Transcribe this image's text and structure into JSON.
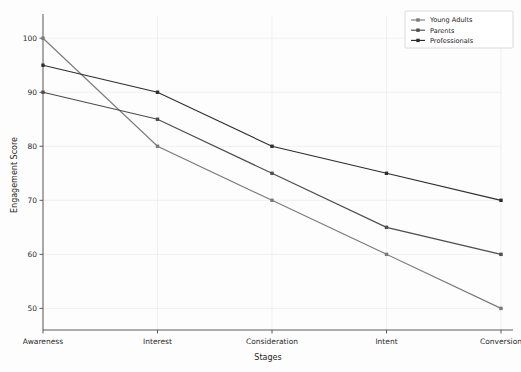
{
  "chart_data": {
    "type": "line",
    "title": "",
    "xlabel": "Stages",
    "ylabel": "Engagement Score",
    "categories": [
      "Awareness",
      "Interest",
      "Consideration",
      "Intent",
      "Conversion"
    ],
    "yticks": [
      50,
      60,
      70,
      80,
      90,
      100
    ],
    "ylim": [
      46,
      103
    ],
    "grid": true,
    "legend_position": "top-right",
    "series": [
      {
        "name": "Young Adults",
        "values": [
          100,
          80,
          70,
          60,
          50
        ],
        "color": "#7a7a7a",
        "marker": "square"
      },
      {
        "name": "Parents",
        "values": [
          90,
          85,
          75,
          65,
          60
        ],
        "color": "#4d4d4d",
        "marker": "square"
      },
      {
        "name": "Professionals",
        "values": [
          95,
          90,
          80,
          75,
          70
        ],
        "color": "#2e2e2e",
        "marker": "square"
      }
    ]
  },
  "axes": {
    "x_title": "Stages",
    "y_title": "Engagement Score",
    "x_tick_labels": [
      "Awareness",
      "Interest",
      "Consideration",
      "Intent",
      "Conversion"
    ],
    "y_tick_labels": [
      "50",
      "60",
      "70",
      "80",
      "90",
      "100"
    ]
  },
  "legend": {
    "entries": [
      {
        "label": "Young Adults"
      },
      {
        "label": "Parents"
      },
      {
        "label": "Professionals"
      }
    ]
  }
}
